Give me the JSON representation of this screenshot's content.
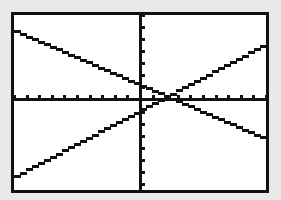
{
  "screen": {
    "description": "Graphing calculator screen showing two intersecting lines",
    "background_color": "#e9e9e9",
    "frame_color": "#111111",
    "plot_color": "#ffffff",
    "line_color": "#111111"
  },
  "chart_data": {
    "type": "line",
    "title": "",
    "xlabel": "",
    "ylabel": "",
    "xlim": [
      -10,
      10
    ],
    "ylim": [
      -7.5,
      7
    ],
    "x_tick_step": 1,
    "y_tick_step": 1,
    "grid": false,
    "axes_through_origin": true,
    "legend": null,
    "series": [
      {
        "name": "line-1 (decreasing)",
        "slope": -0.45,
        "intercept": 1.25,
        "x": [
          -10,
          10
        ],
        "y": [
          5.75,
          -3.25
        ]
      },
      {
        "name": "line-2 (increasing)",
        "slope": 0.55,
        "intercept": -0.95,
        "x": [
          -10,
          10
        ],
        "y": [
          -6.45,
          4.55
        ]
      }
    ],
    "annotations": [
      {
        "type": "intersection",
        "x": 2.2,
        "y": 0.26
      }
    ]
  }
}
